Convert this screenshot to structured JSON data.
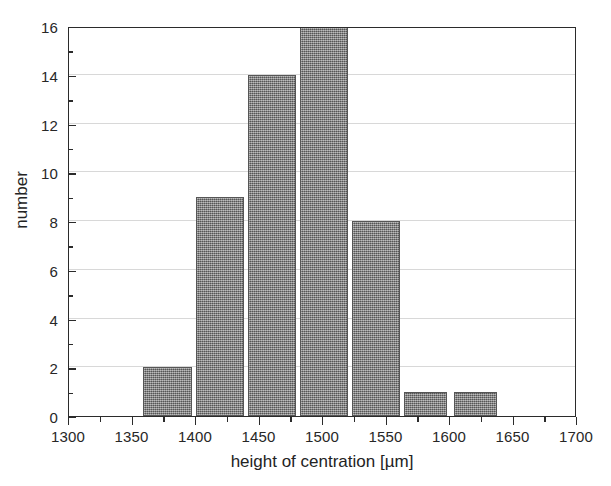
{
  "chart_data": {
    "type": "bar",
    "title": "",
    "subtitle": "",
    "xlabel": "height of centration [µm]",
    "ylabel": "number",
    "xlim": [
      1300,
      1700
    ],
    "ylim": [
      0,
      16
    ],
    "xtick_step": 50,
    "ytick_step": 2,
    "x_minor_tick_step": 25,
    "y_minor_tick_step": 1,
    "grid": "horizontal-major",
    "legend": "none",
    "bar_color": "#7d7d7d",
    "bar_edge_color": "#565656",
    "axis_color": "#2b2b2b",
    "gridline_color": "#d8d8d8",
    "background": "#ffffff",
    "bin_width": 40,
    "bars": [
      {
        "bin_start": 1358,
        "bin_end": 1397,
        "center": 1377.5,
        "value": 2
      },
      {
        "bin_start": 1400,
        "bin_end": 1438,
        "center": 1419.0,
        "value": 9
      },
      {
        "bin_start": 1441,
        "bin_end": 1479,
        "center": 1460.0,
        "value": 14
      },
      {
        "bin_start": 1482,
        "bin_end": 1520,
        "center": 1501.0,
        "value": 16
      },
      {
        "bin_start": 1523,
        "bin_end": 1561,
        "center": 1542.0,
        "value": 8
      },
      {
        "bin_start": 1564,
        "bin_end": 1598,
        "center": 1581.0,
        "value": 1
      },
      {
        "bin_start": 1603,
        "bin_end": 1637,
        "center": 1620.0,
        "value": 1
      }
    ],
    "categories": [
      "1377.5",
      "1419",
      "1460",
      "1501",
      "1542",
      "1581",
      "1620"
    ],
    "values": [
      2,
      9,
      14,
      16,
      8,
      1,
      1
    ],
    "xticklabels": [
      "1300",
      "1350",
      "1400",
      "1450",
      "1500",
      "1550",
      "1600",
      "1650",
      "1700"
    ],
    "xtickvalues": [
      1300,
      1350,
      1400,
      1450,
      1500,
      1550,
      1600,
      1650,
      1700
    ],
    "yticklabels": [
      "0",
      "2",
      "4",
      "6",
      "8",
      "10",
      "12",
      "14",
      "16"
    ],
    "ytickvalues": [
      0,
      2,
      4,
      6,
      8,
      10,
      12,
      14,
      16
    ]
  }
}
